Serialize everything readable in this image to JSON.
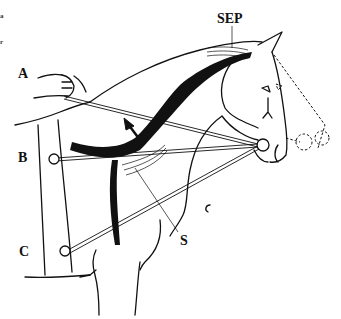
{
  "figure": {
    "labels": {
      "a": "A",
      "b": "B",
      "c": "C",
      "sep": "SEP",
      "s": "S"
    },
    "edge_text": [
      "a",
      "r"
    ],
    "colors": {
      "ink": "#111111",
      "background": "#ffffff"
    }
  }
}
